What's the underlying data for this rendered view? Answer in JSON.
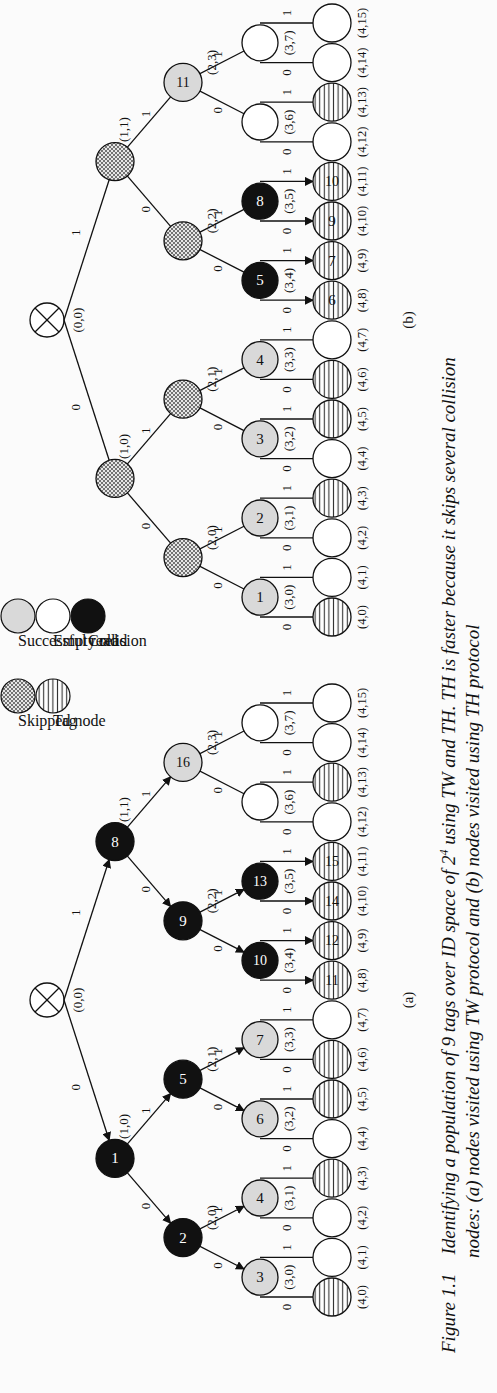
{
  "figure": {
    "number": "Figure 1.1",
    "caption_line1": "Identifying a population of 9 tags over ID space of 2",
    "caption_superscript": "4",
    "caption_line1_tail": " using TW and TH. TH is faster because it skips several collision",
    "caption_line2": "nodes: (a) nodes visited using TW protocol and (b) nodes visited using TH protocol"
  },
  "legend": {
    "items": [
      {
        "label": "Skipped node",
        "style": "skipped"
      },
      {
        "label": "Tag",
        "style": "tag"
      },
      {
        "label": "Successful read",
        "style": "success"
      },
      {
        "label": "Empty read",
        "style": "empty"
      },
      {
        "label": "Collision",
        "style": "collision"
      }
    ]
  },
  "colors": {
    "success": "#d9d9d9",
    "empty": "#ffffff",
    "collision": "#111111",
    "skipped_hatch": "#555555",
    "tag_lines": "#333333"
  },
  "panels": [
    {
      "id": "a",
      "label": "(a)",
      "root_label": "(0,0)",
      "edge_labels": {
        "left": "0",
        "right": "1"
      },
      "level1": [
        {
          "coord": "(1,0)",
          "type": "collision",
          "order": "1"
        },
        {
          "coord": "(1,1)",
          "type": "collision",
          "order": "8"
        }
      ],
      "level2": [
        {
          "coord": "(2,0)",
          "type": "collision",
          "order": "2"
        },
        {
          "coord": "(2,1)",
          "type": "collision",
          "order": "5"
        },
        {
          "coord": "(2,2)",
          "type": "collision",
          "order": "9"
        },
        {
          "coord": "(2,3)",
          "type": "success",
          "order": "16"
        }
      ],
      "level3": [
        {
          "coord": "(3,0)",
          "type": "success",
          "order": "3"
        },
        {
          "coord": "(3,1)",
          "type": "success",
          "order": "4"
        },
        {
          "coord": "(3,2)",
          "type": "success",
          "order": "6"
        },
        {
          "coord": "(3,3)",
          "type": "success",
          "order": "7"
        },
        {
          "coord": "(3,4)",
          "type": "collision",
          "order": "10"
        },
        {
          "coord": "(3,5)",
          "type": "collision",
          "order": "13"
        },
        {
          "coord": "(3,6)",
          "type": "empty",
          "order": ""
        },
        {
          "coord": "(3,7)",
          "type": "empty",
          "order": ""
        }
      ],
      "level4": [
        {
          "coord": "(4,0)",
          "tag": true,
          "order": ""
        },
        {
          "coord": "(4,1)",
          "tag": false,
          "order": ""
        },
        {
          "coord": "(4,2)",
          "tag": false,
          "order": ""
        },
        {
          "coord": "(4,3)",
          "tag": true,
          "order": ""
        },
        {
          "coord": "(4,4)",
          "tag": false,
          "order": ""
        },
        {
          "coord": "(4,5)",
          "tag": true,
          "order": ""
        },
        {
          "coord": "(4,6)",
          "tag": true,
          "order": ""
        },
        {
          "coord": "(4,7)",
          "tag": false,
          "order": ""
        },
        {
          "coord": "(4,8)",
          "tag": true,
          "order": "11"
        },
        {
          "coord": "(4,9)",
          "tag": true,
          "order": "12"
        },
        {
          "coord": "(4,10)",
          "tag": true,
          "order": "14"
        },
        {
          "coord": "(4,11)",
          "tag": true,
          "order": "15"
        },
        {
          "coord": "(4,12)",
          "tag": false,
          "order": ""
        },
        {
          "coord": "(4,13)",
          "tag": true,
          "order": ""
        },
        {
          "coord": "(4,14)",
          "tag": false,
          "order": ""
        },
        {
          "coord": "(4,15)",
          "tag": false,
          "order": ""
        }
      ]
    },
    {
      "id": "b",
      "label": "(b)",
      "root_label": "(0,0)",
      "edge_labels": {
        "left": "0",
        "right": "1"
      },
      "level1": [
        {
          "coord": "(1,0)",
          "type": "skipped",
          "order": ""
        },
        {
          "coord": "(1,1)",
          "type": "skipped",
          "order": ""
        }
      ],
      "level2": [
        {
          "coord": "(2,0)",
          "type": "skipped",
          "order": ""
        },
        {
          "coord": "(2,1)",
          "type": "skipped",
          "order": ""
        },
        {
          "coord": "(2,2)",
          "type": "skipped",
          "order": ""
        },
        {
          "coord": "(2,3)",
          "type": "success",
          "order": "11"
        }
      ],
      "level3": [
        {
          "coord": "(3,0)",
          "type": "success",
          "order": "1"
        },
        {
          "coord": "(3,1)",
          "type": "success",
          "order": "2"
        },
        {
          "coord": "(3,2)",
          "type": "success",
          "order": "3"
        },
        {
          "coord": "(3,3)",
          "type": "success",
          "order": "4"
        },
        {
          "coord": "(3,4)",
          "type": "collision",
          "order": "5"
        },
        {
          "coord": "(3,5)",
          "type": "collision",
          "order": "8"
        },
        {
          "coord": "(3,6)",
          "type": "empty",
          "order": ""
        },
        {
          "coord": "(3,7)",
          "type": "empty",
          "order": ""
        }
      ],
      "level4": [
        {
          "coord": "(4,0)",
          "tag": true,
          "order": ""
        },
        {
          "coord": "(4,1)",
          "tag": false,
          "order": ""
        },
        {
          "coord": "(4,2)",
          "tag": false,
          "order": ""
        },
        {
          "coord": "(4,3)",
          "tag": true,
          "order": ""
        },
        {
          "coord": "(4,4)",
          "tag": false,
          "order": ""
        },
        {
          "coord": "(4,5)",
          "tag": true,
          "order": ""
        },
        {
          "coord": "(4,6)",
          "tag": true,
          "order": ""
        },
        {
          "coord": "(4,7)",
          "tag": false,
          "order": ""
        },
        {
          "coord": "(4,8)",
          "tag": true,
          "order": "6"
        },
        {
          "coord": "(4,9)",
          "tag": true,
          "order": "7"
        },
        {
          "coord": "(4,10)",
          "tag": true,
          "order": "9"
        },
        {
          "coord": "(4,11)",
          "tag": true,
          "order": "10"
        },
        {
          "coord": "(4,12)",
          "tag": false,
          "order": ""
        },
        {
          "coord": "(4,13)",
          "tag": true,
          "order": ""
        },
        {
          "coord": "(4,14)",
          "tag": false,
          "order": ""
        },
        {
          "coord": "(4,15)",
          "tag": false,
          "order": ""
        }
      ]
    }
  ]
}
